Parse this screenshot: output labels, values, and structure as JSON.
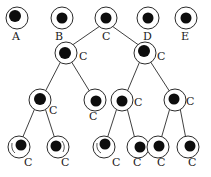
{
  "diagram": {
    "type": "cell-lineage-tree",
    "colors": {
      "stroke": "#2a2a2a",
      "nucleus": "#0d0d0d",
      "background": "#ffffff"
    },
    "top_row": [
      {
        "id": "A",
        "label": "A",
        "x": 17,
        "y": 18
      },
      {
        "id": "B",
        "label": "B",
        "x": 62,
        "y": 18
      },
      {
        "id": "C0",
        "label": "C",
        "x": 106,
        "y": 18
      },
      {
        "id": "D",
        "label": "D",
        "x": 148,
        "y": 18
      },
      {
        "id": "E",
        "label": "E",
        "x": 186,
        "y": 18
      }
    ],
    "descendants": [
      {
        "id": "C1",
        "label": "C",
        "x": 66,
        "y": 53,
        "parent": "C0"
      },
      {
        "id": "C2",
        "label": "C",
        "x": 145,
        "y": 53,
        "parent": "C0"
      },
      {
        "id": "C3",
        "label": "C",
        "x": 40,
        "y": 100,
        "parent": "C1"
      },
      {
        "id": "C4",
        "label": "C",
        "x": 95,
        "y": 100,
        "parent": "C1"
      },
      {
        "id": "C5",
        "label": "C",
        "x": 122,
        "y": 100,
        "parent": "C2"
      },
      {
        "id": "C6",
        "label": "C",
        "x": 175,
        "y": 100,
        "parent": "C2"
      },
      {
        "id": "C7",
        "label": "C",
        "x": 19,
        "y": 147,
        "parent": "C3"
      },
      {
        "id": "C8",
        "label": "C",
        "x": 58,
        "y": 147,
        "parent": "C3"
      },
      {
        "id": "C9",
        "label": "C",
        "x": 104,
        "y": 147,
        "parent": "C5"
      },
      {
        "id": "C10",
        "label": "C",
        "x": 138,
        "y": 147,
        "parent": "C5"
      },
      {
        "id": "C11",
        "label": "C",
        "x": 158,
        "y": 147,
        "parent": "C6"
      },
      {
        "id": "C12",
        "label": "C",
        "x": 188,
        "y": 147,
        "parent": "C6"
      }
    ]
  }
}
